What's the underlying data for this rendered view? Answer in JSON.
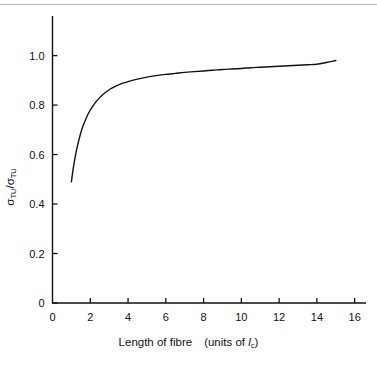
{
  "figure": {
    "background": "#ffffff",
    "ink_color": "#111111",
    "top_rule_color": "#b9b9b9"
  },
  "axis_titles": {
    "x_main": "Length of fibre",
    "x_units_open": "(units of ",
    "x_units_symbol": "l",
    "x_units_subscript": "c",
    "x_units_close": ")",
    "y_numerator_symbol": "σ",
    "y_numerator_sub": "TU",
    "y_divider": "/",
    "y_denominator_symbol": "σ",
    "y_denominator_sub": "TU"
  },
  "chart_data": {
    "type": "line",
    "title": "",
    "subtitle": "",
    "xlabel": "Length of fibre (units of lc)",
    "ylabel": "σTU/σTU",
    "xlim": [
      0,
      16.6
    ],
    "ylim": [
      0,
      1.16
    ],
    "grid": false,
    "legend": null,
    "x_ticks": [
      0,
      2,
      4,
      6,
      8,
      10,
      12,
      14,
      16
    ],
    "x_tick_labels": [
      "0",
      "2",
      "4",
      "6",
      "8",
      "10",
      "12",
      "14",
      "16"
    ],
    "y_ticks": [
      0,
      0.2,
      0.4,
      0.6,
      0.8,
      1.0
    ],
    "y_tick_labels": [
      "0",
      "0.2",
      "0.4",
      "0.6",
      "0.8",
      "1.0"
    ],
    "tick_direction": "in",
    "series": [
      {
        "name": "strength ratio",
        "color": "#111111",
        "line_width": 1.4,
        "x": [
          1.0,
          1.1,
          1.2,
          1.3,
          1.4,
          1.5,
          1.6,
          1.8,
          2.0,
          2.2,
          2.4,
          2.6,
          2.8,
          3.0,
          3.25,
          3.5,
          3.75,
          4.0,
          4.5,
          5.0,
          5.5,
          6.0,
          6.5,
          7.0,
          7.5,
          8.0,
          8.5,
          9.0,
          9.5,
          10.0,
          10.5,
          11.0,
          11.5,
          12.0,
          12.5,
          13.0,
          13.5,
          14.0,
          14.5,
          15.0
        ],
        "y": [
          0.49,
          0.545,
          0.59,
          0.628,
          0.66,
          0.688,
          0.712,
          0.75,
          0.78,
          0.803,
          0.822,
          0.838,
          0.851,
          0.862,
          0.873,
          0.882,
          0.889,
          0.895,
          0.905,
          0.913,
          0.919,
          0.924,
          0.928,
          0.932,
          0.935,
          0.938,
          0.941,
          0.944,
          0.946,
          0.948,
          0.951,
          0.953,
          0.955,
          0.957,
          0.959,
          0.961,
          0.963,
          0.965,
          0.972,
          0.98
        ]
      }
    ]
  }
}
